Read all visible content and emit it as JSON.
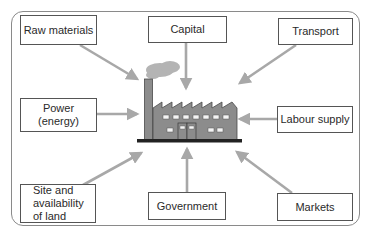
{
  "diagram": {
    "center": "factory",
    "factors": [
      {
        "id": "raw-materials",
        "label": "Raw materials"
      },
      {
        "id": "capital",
        "label": "Capital"
      },
      {
        "id": "transport",
        "label": "Transport"
      },
      {
        "id": "power",
        "label": "Power\n(energy)"
      },
      {
        "id": "labour-supply",
        "label": "Labour supply"
      },
      {
        "id": "site",
        "label": "Site and\navailability\nof land"
      },
      {
        "id": "government",
        "label": "Government"
      },
      {
        "id": "markets",
        "label": "Markets"
      }
    ],
    "colors": {
      "arrow": "#a8a8a8",
      "factory": "#8c8c8c",
      "factory_outline": "#4a4a4a",
      "smoke": "#b4b4b4",
      "ground": "#222222",
      "box_border": "#555555",
      "frame": "#8a8a8a"
    }
  }
}
